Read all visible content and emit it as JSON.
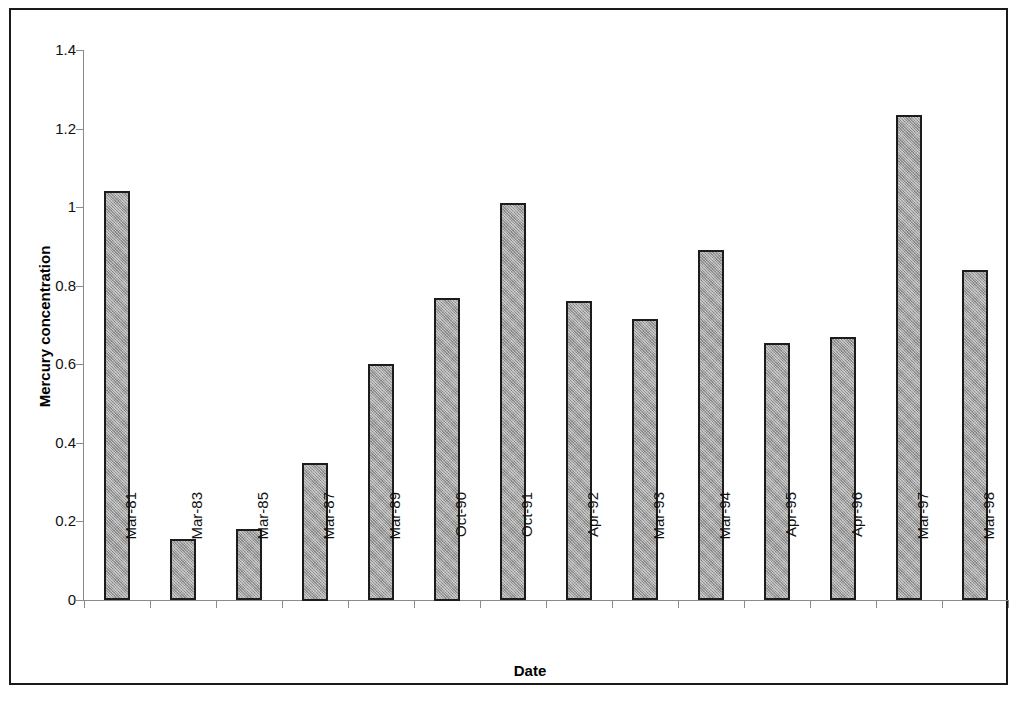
{
  "chart_data": {
    "type": "bar",
    "title": "",
    "xlabel": "Date",
    "ylabel": "Mercury concentration",
    "categories": [
      "Mar-81",
      "Mar-83",
      "Mar-85",
      "Mar-87",
      "Mar-89",
      "Oct-90",
      "Oct-91",
      "Apr-92",
      "Mar-93",
      "Mar-94",
      "Apr-95",
      "Apr-96",
      "Mar-97",
      "Mar-98"
    ],
    "values": [
      1.04,
      0.155,
      0.18,
      0.35,
      0.6,
      0.77,
      1.01,
      0.76,
      0.715,
      0.89,
      0.655,
      0.67,
      1.235,
      0.84
    ],
    "series": [
      {
        "name": "Mercury concentration",
        "values": [
          1.04,
          0.155,
          0.18,
          0.35,
          0.6,
          0.77,
          1.01,
          0.76,
          0.715,
          0.89,
          0.655,
          0.67,
          1.235,
          0.84
        ]
      }
    ],
    "ylim": [
      0,
      1.4
    ],
    "ytick_values": [
      0,
      0.2,
      0.4,
      0.6,
      0.8,
      1.0,
      1.2,
      1.4
    ],
    "ytick_labels": [
      "0",
      "0.2",
      "0.4",
      "0.6",
      "0.8",
      "1",
      "1.2",
      "1.4"
    ],
    "grid": false,
    "legend": false,
    "legend_position": "none",
    "bar_fill_color": "#9e9e9e",
    "bar_border_color": "#1c1c1c",
    "axis_color": "#8a8a8a",
    "frame_color": "#1a1a1a",
    "background_color": "#ffffff"
  }
}
